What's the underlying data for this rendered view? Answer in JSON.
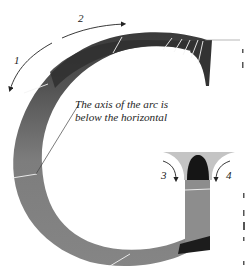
{
  "diagram": {
    "stroke_labels": [
      {
        "id": "1",
        "text": "1"
      },
      {
        "id": "2",
        "text": "2"
      },
      {
        "id": "3",
        "text": "3"
      },
      {
        "id": "4",
        "text": "4"
      }
    ],
    "annotation": {
      "line1": "The axis of the arc is",
      "line2": "below the horizontal"
    },
    "colors": {
      "stroke_dark": "#2e2e2e",
      "stroke_mid": "#6f6f6f",
      "stroke_light": "#8a8a8a",
      "serif_light": "#bdbdbd",
      "hairline": "#f4f4f4",
      "arrow": "#222222",
      "background": "#ffffff"
    }
  }
}
